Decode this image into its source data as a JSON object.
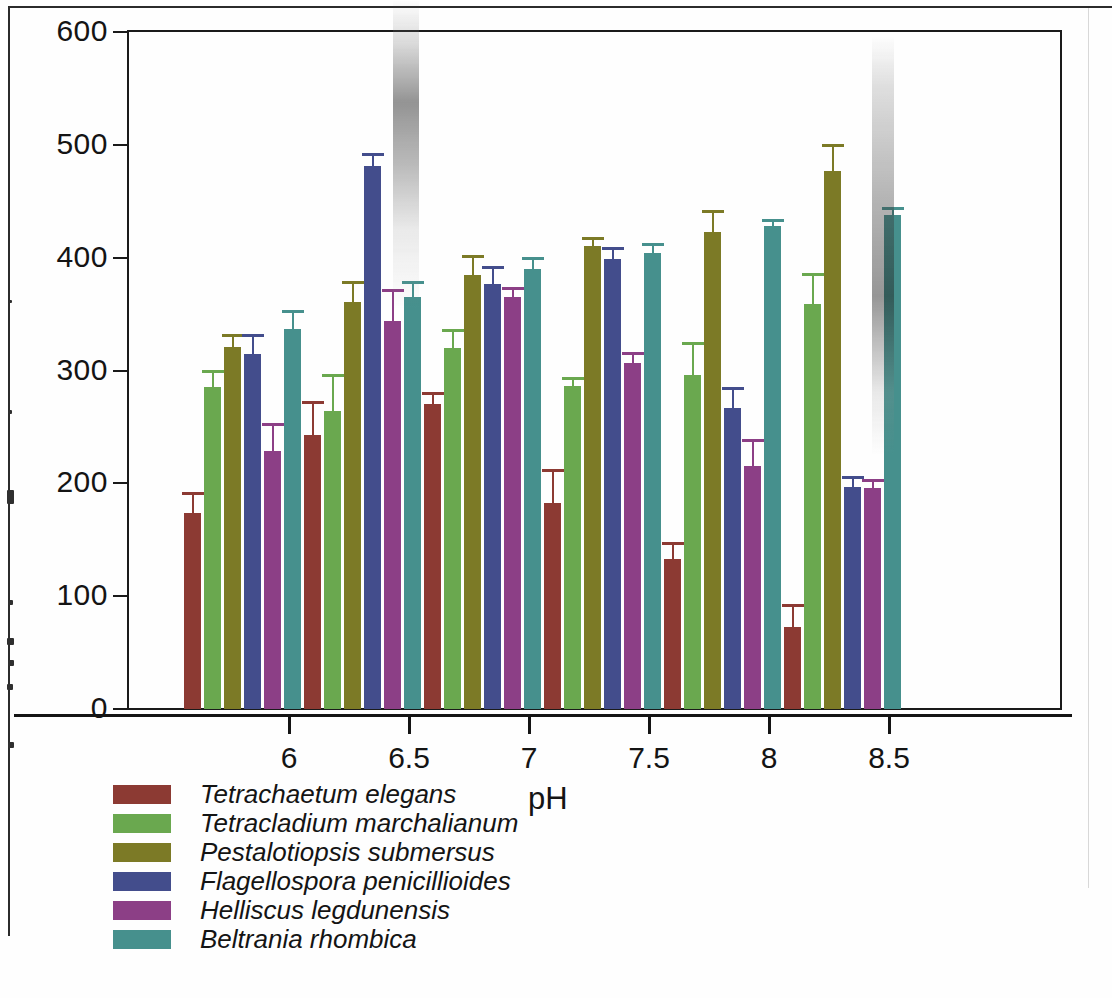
{
  "chart_data": {
    "type": "bar",
    "title": "",
    "xlabel": "pH",
    "ylabel": "",
    "categories": [
      "6",
      "6.5",
      "7",
      "7.5",
      "8",
      "8.5"
    ],
    "ylim": [
      0,
      600
    ],
    "yticks": [
      0,
      100,
      200,
      300,
      400,
      500,
      600
    ],
    "grid": false,
    "legend_position": "bottom-left",
    "error_bars": "standard error",
    "series": [
      {
        "name": "Tetrachaetum elegans",
        "color": "#8c3a33",
        "values": [
          174,
          243,
          270,
          183,
          133,
          73
        ],
        "errors": [
          16,
          27,
          8,
          27,
          12,
          17
        ]
      },
      {
        "name": "Tetracladium marchalianum",
        "color": "#6aa84f",
        "values": [
          285,
          264,
          320,
          286,
          296,
          359
        ],
        "errors": [
          13,
          30,
          14,
          6,
          27,
          25
        ]
      },
      {
        "name": "Pestalotiopsis submersus",
        "color": "#7c7a26",
        "values": [
          321,
          361,
          385,
          410,
          423,
          477
        ],
        "errors": [
          9,
          16,
          15,
          6,
          17,
          21
        ]
      },
      {
        "name": "Flagellospora penicillioides",
        "color": "#434d8c",
        "values": [
          315,
          481,
          377,
          399,
          267,
          197
        ],
        "errors": [
          15,
          9,
          13,
          8,
          16,
          7
        ]
      },
      {
        "name": "Helliscus legdunensis",
        "color": "#8c3f86",
        "values": [
          229,
          344,
          365,
          307,
          215,
          196
        ],
        "errors": [
          22,
          26,
          6,
          7,
          22,
          5
        ]
      },
      {
        "name": "Beltrania rhombica",
        "color": "#46908d",
        "values": [
          337,
          365,
          390,
          404,
          428,
          438
        ],
        "errors": [
          14,
          12,
          8,
          6,
          4,
          4
        ]
      }
    ]
  },
  "axes": {
    "y_tick_labels": [
      "600",
      "500",
      "400",
      "300",
      "200",
      "100",
      "0"
    ],
    "x_tick_labels": [
      "6",
      "6.5",
      "7",
      "7.5",
      "8",
      "8.5"
    ],
    "x_axis_title": "pH"
  },
  "legend": {
    "items": [
      {
        "label": "Tetrachaetum elegans",
        "color": "#8c3a33"
      },
      {
        "label": "Tetracladium marchalianum",
        "color": "#6aa84f"
      },
      {
        "label": "Pestalotiopsis submersus",
        "color": "#7c7a26"
      },
      {
        "label": "Flagellospora penicillioides",
        "color": "#434d8c"
      },
      {
        "label": "Helliscus legdunensis",
        "color": "#8c3f86"
      },
      {
        "label": "Beltrania rhombica",
        "color": "#46908d"
      }
    ]
  }
}
